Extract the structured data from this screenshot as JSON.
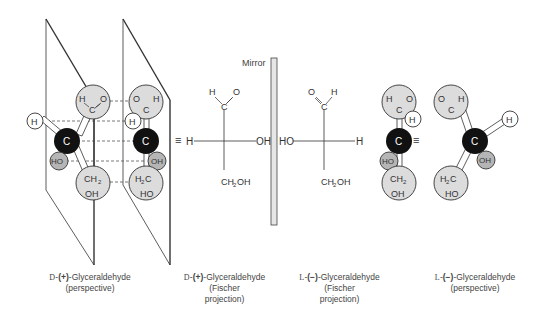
{
  "mirror": {
    "label": "Mirror"
  },
  "equivalence_symbol": "≡",
  "captions": [
    {
      "config": "D",
      "sign": "(+)",
      "name": "-Glyceraldehyde",
      "sub1": "(perspective)",
      "sub2": ""
    },
    {
      "config": "D",
      "sign": "(+)",
      "name": "-Glyceraldehyde",
      "sub1": "(Fischer",
      "sub2": "projection)"
    },
    {
      "config": "L",
      "sign": "(−)",
      "name": "-Glyceraldehyde",
      "sub1": "(Fischer",
      "sub2": "projection)"
    },
    {
      "config": "L",
      "sign": "(−)",
      "name": "-Glyceraldehyde",
      "sub1": "(perspective)",
      "sub2": ""
    }
  ],
  "fischer_left": {
    "top_h": "H",
    "top_c": "C",
    "top_o": "O",
    "left": "H",
    "right": "OH",
    "bottom": "CH₂OH"
  },
  "fischer_right": {
    "top_h": "H",
    "top_c": "C",
    "top_o": "O",
    "left": "HO",
    "right": "H",
    "bottom": "CH₂OH"
  },
  "atoms": {
    "carbon": "C",
    "hydrogen": "H",
    "hydroxyl_left": "HO",
    "hydroxyl_right": "OH",
    "ch2": "CH₂",
    "h2c": "H₂C",
    "oh": "OH",
    "ho": "HO",
    "o": "O"
  },
  "colors": {
    "carbon": "#111111",
    "group": "#dcdcdc",
    "hydroxyl": "#b5b5b5",
    "hydrogen": "#ffffff",
    "line": "#333333"
  }
}
